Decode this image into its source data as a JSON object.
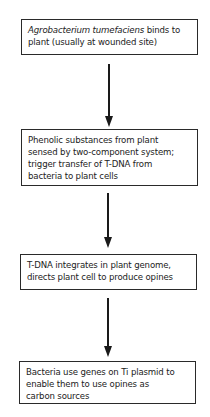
{
  "diagram": {
    "type": "flowchart",
    "direction": "top-to-bottom",
    "steps": [
      {
        "id": "step-1",
        "lines": [
          {
            "italic": "Agrobacterium tumefaciens",
            "normal": " binds to"
          },
          {
            "italic": "",
            "normal": "plant (usually at wounded site)"
          }
        ]
      },
      {
        "id": "step-2",
        "lines": [
          {
            "italic": "",
            "normal": "Phenolic substances from plant"
          },
          {
            "italic": "",
            "normal": "sensed by two-component system;"
          },
          {
            "italic": "",
            "normal": "trigger transfer of T-DNA from"
          },
          {
            "italic": "",
            "normal": "bacteria to plant cells"
          }
        ]
      },
      {
        "id": "step-3",
        "lines": [
          {
            "italic": "",
            "normal": "T-DNA integrates in plant genome,"
          },
          {
            "italic": "",
            "normal": "directs plant cell to produce opines"
          }
        ]
      },
      {
        "id": "step-4",
        "lines": [
          {
            "italic": "",
            "normal": "Bacteria use genes on Ti plasmid to"
          },
          {
            "italic": "",
            "normal": "enable them to use opines as"
          },
          {
            "italic": "",
            "normal": "carbon sources"
          }
        ]
      }
    ],
    "connectors": [
      {
        "from": "step-1",
        "to": "step-2"
      },
      {
        "from": "step-2",
        "to": "step-3"
      },
      {
        "from": "step-3",
        "to": "step-4"
      }
    ],
    "colors": {
      "border": "#2a2a2a",
      "arrow": "#1a1a1a",
      "text": "#222222",
      "background": "#ffffff"
    }
  }
}
